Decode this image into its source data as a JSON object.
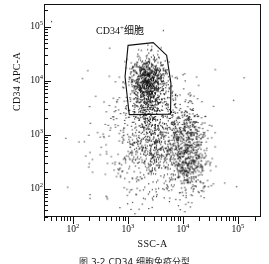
{
  "figure": {
    "caption": "图 3-2 CD34 细胞免疫分型"
  },
  "axes": {
    "x": {
      "title": "SSC-A",
      "scale": "log",
      "range": [
        30,
        262144
      ],
      "tick_labels": [
        "10",
        "10",
        "10",
        "10"
      ],
      "tick_exponents": [
        "2",
        "3",
        "4",
        "5"
      ],
      "tick_values": [
        100,
        1000,
        10000,
        100000
      ]
    },
    "y": {
      "title": "CD34 APC-A",
      "scale": "log",
      "range": [
        30,
        262144
      ],
      "tick_labels": [
        "10",
        "10",
        "10",
        "10"
      ],
      "tick_exponents": [
        "2",
        "3",
        "4",
        "5"
      ],
      "tick_values": [
        100,
        1000,
        10000,
        100000
      ]
    }
  },
  "gate": {
    "label_text": "CD34",
    "label_superscript": "+",
    "label_suffix": "细胞",
    "stroke_color": "#111111",
    "vertices": [
      [
        1000,
        46000
      ],
      [
        2900,
        52000
      ],
      [
        5100,
        30000
      ],
      [
        6100,
        9000
      ],
      [
        6000,
        2400
      ],
      [
        1050,
        2350
      ],
      [
        880,
        12000
      ]
    ]
  },
  "chart_data": {
    "type": "scatter",
    "title": "",
    "xlabel": "SSC-A",
    "ylabel": "CD34 APC-A",
    "xscale": "log",
    "yscale": "log",
    "xlim": [
      30,
      262144
    ],
    "ylim": [
      30,
      262144
    ],
    "grid": false,
    "legend": null,
    "point_color": "#111111",
    "point_size_px": 1.1,
    "annotations": [
      {
        "text": "CD34+细胞",
        "x": 2400,
        "y": 90000,
        "type": "gate-label"
      }
    ],
    "populations": [
      {
        "name": "CD34+ gated cluster",
        "n": 760,
        "center": [
          2400,
          10000
        ],
        "log_sigma": [
          0.17,
          0.22
        ],
        "description": "dense CD34 positive population enclosed by polygon gate"
      },
      {
        "name": "CD34+ lower tail",
        "n": 190,
        "center": [
          2300,
          4200
        ],
        "log_sigma": [
          0.13,
          0.21
        ],
        "description": "lower extension of gated cluster toward 3x10^3"
      },
      {
        "name": "diffuse mid population",
        "n": 620,
        "center": [
          3000,
          700
        ],
        "log_sigma": [
          0.33,
          0.42
        ],
        "description": "broad diffuse cloud below the gate"
      },
      {
        "name": "high SSC lobe",
        "n": 520,
        "center": [
          13000,
          350
        ],
        "log_sigma": [
          0.18,
          0.33
        ],
        "description": "dense lobe at high side scatter, low CD34"
      },
      {
        "name": "high SSC upper streak",
        "n": 180,
        "center": [
          12000,
          1400
        ],
        "log_sigma": [
          0.17,
          0.27
        ],
        "description": "vertical streak above high SSC lobe"
      },
      {
        "name": "sparse background",
        "n": 330,
        "center": [
          2500,
          900
        ],
        "log_sigma": [
          0.62,
          0.72
        ],
        "description": "sparse scattered background events across plot"
      }
    ],
    "total_events": 2600
  }
}
